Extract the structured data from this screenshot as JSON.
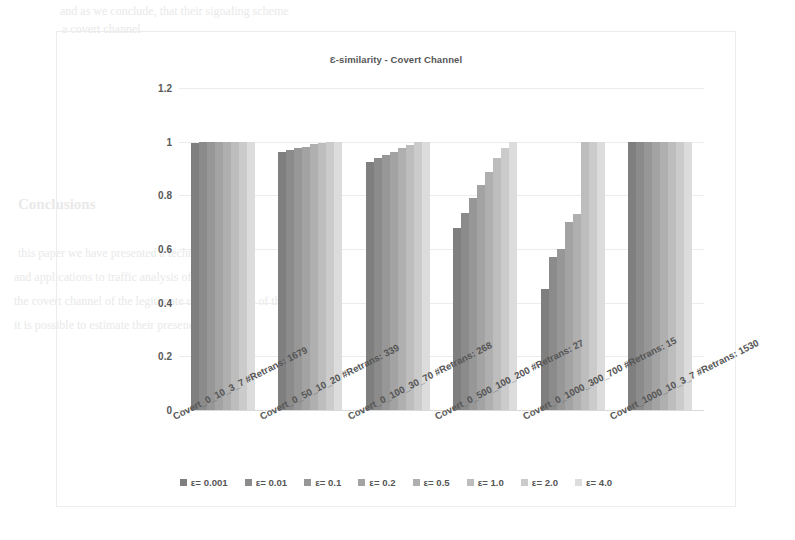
{
  "chart_data": {
    "type": "bar",
    "title": "Ɛ-similarity - Covert Channel",
    "xlabel": "",
    "ylabel": "",
    "ylim": [
      0,
      1.2
    ],
    "ytick_labels": [
      "1.2",
      "1",
      "0.8",
      "0.6",
      "0.4",
      "0.2",
      "0"
    ],
    "ytick_values": [
      1.2,
      1.0,
      0.8,
      0.6,
      0.4,
      0.2,
      0
    ],
    "grid": true,
    "legend_position": "bottom",
    "categories": [
      "Covert_0_10_3_7 #Retrans: 1679",
      "Covert_0_50_10_20 #Retrans: 339",
      "Covert_0_100_30_70 #Retrans: 268",
      "Covert_0_500_100_200 #Retrans: 27",
      "Covert_0_1000_300_700 #Retrans: 15",
      "Covert_1000_10_3_7 #Retrans: 1530"
    ],
    "series": [
      {
        "name": "ε= 0.001",
        "color": "#7f7f7f",
        "values": [
          0.995,
          0.96,
          0.925,
          0.68,
          0.45,
          1.0
        ]
      },
      {
        "name": "ε= 0.01",
        "color": "#8b8b8b",
        "values": [
          0.998,
          0.968,
          0.938,
          0.735,
          0.57,
          1.0
        ]
      },
      {
        "name": "ε= 0.1",
        "color": "#979797",
        "values": [
          1.0,
          0.975,
          0.95,
          0.79,
          0.6,
          1.0
        ]
      },
      {
        "name": "ε= 0.2",
        "color": "#a3a3a3",
        "values": [
          1.0,
          0.982,
          0.962,
          0.84,
          0.7,
          1.0
        ]
      },
      {
        "name": "ε= 0.5",
        "color": "#afafaf",
        "values": [
          1.0,
          0.99,
          0.975,
          0.888,
          0.73,
          1.0
        ]
      },
      {
        "name": "ε= 1.0",
        "color": "#bdbdbd",
        "values": [
          1.0,
          0.996,
          0.988,
          0.94,
          1.0,
          1.0
        ]
      },
      {
        "name": "ε= 2.0",
        "color": "#cbcbcb",
        "values": [
          1.0,
          1.0,
          1.0,
          0.975,
          1.0,
          1.0
        ]
      },
      {
        "name": "ε= 4.0",
        "color": "#dcdcdc",
        "values": [
          1.0,
          1.0,
          1.0,
          1.0,
          1.0,
          1.0
        ]
      }
    ]
  },
  "page_bleed": {
    "line1": "and as we conclude, that their signaling scheme",
    "line2": "a covert channel",
    "line3": "Conclusions",
    "line4": "this paper we have presented a technique that",
    "line5": "and applications to traffic analysis of the",
    "line6": "the covert channel of the legitimate user and those of their",
    "line7": "it is possible to estimate their presence"
  }
}
